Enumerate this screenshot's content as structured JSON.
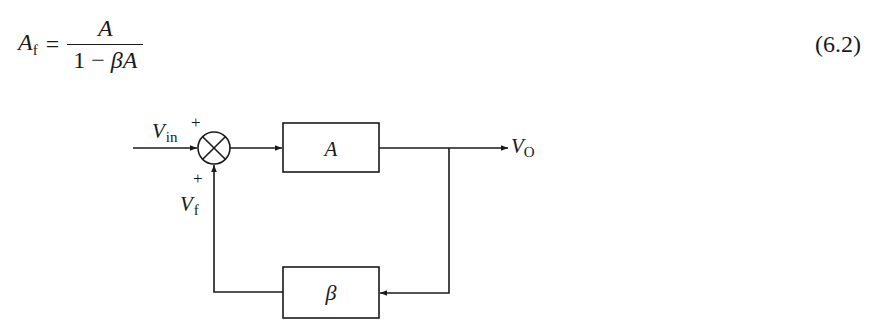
{
  "equation": {
    "lhs_symbol": "A",
    "lhs_subscript": "f",
    "equals": "=",
    "numerator": "A",
    "denominator_prefix": "1 − ",
    "denominator_beta": "β",
    "denominator_A": "A",
    "number": "(6.2)"
  },
  "diagram": {
    "input_label": "V",
    "input_subscript": "in",
    "input_sign": "+",
    "feedback_sign": "+",
    "feedback_label": "V",
    "feedback_subscript": "f",
    "forward_block": "A",
    "feedback_block": "β",
    "output_label": "V",
    "output_subscript": "O",
    "summing_junction": "⊗",
    "line_color": "#1a1a1a"
  }
}
